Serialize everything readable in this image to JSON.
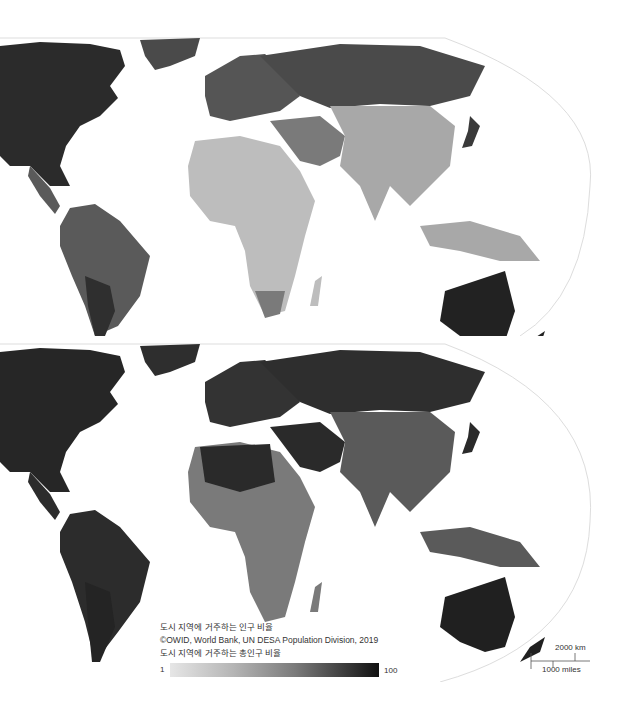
{
  "maps": [
    {
      "id": "map-top",
      "description": "World choropleth (grayscale) – earlier period, lighter urban shares",
      "colors": {
        "land_north_america": "#2b2b2b",
        "land_south_america": "#5a5a5a",
        "land_argentina": "#2f2f2f",
        "land_europe": "#555555",
        "land_russia": "#4a4a4a",
        "land_africa": "#bdbdbd",
        "land_middle_east": "#7a7a7a",
        "land_asia": "#a8a8a8",
        "land_australia": "#222222",
        "land_greenland": "#4a4a4a",
        "land_japan": "#3a3a3a"
      }
    },
    {
      "id": "map-bottom",
      "description": "World choropleth (grayscale) – later period, darker urban shares",
      "colors": {
        "land_north_america": "#262626",
        "land_south_america": "#2c2c2c",
        "land_argentina": "#242424",
        "land_europe": "#333333",
        "land_russia": "#2e2e2e",
        "land_africa": "#7a7a7a",
        "land_middle_east": "#2a2a2a",
        "land_asia": "#5a5a5a",
        "land_australia": "#202020",
        "land_greenland": "#2e2e2e",
        "land_japan": "#2a2a2a"
      }
    }
  ],
  "legend": {
    "title": "도시 지역에 거주하는 인구 비율",
    "source": "©OWID, World Bank, UN DESA Population Division, 2019",
    "subtitle": "도시 지역에 거주하는 총인구 비율",
    "min_label": "1",
    "max_label": "100"
  },
  "scale_bar": {
    "km_label": "2000 km",
    "miles_label": "1000 miles"
  }
}
